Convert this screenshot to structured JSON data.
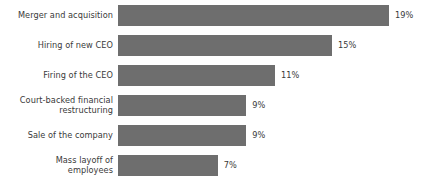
{
  "chart_data": {
    "type": "bar",
    "orientation": "horizontal",
    "title": "",
    "subtitle": "",
    "xlabel": "",
    "ylabel": "",
    "grid": false,
    "legend": null,
    "axis_visible": false,
    "xlim": [
      0,
      19
    ],
    "value_suffix": "%",
    "bar_color": "#6e6e6e",
    "label_color": "#3a3a3a",
    "background_color": "#ffffff",
    "categories": [
      "Merger and acquisition",
      "Hiring of new CEO",
      "Firing of the CEO",
      "Court-backed financial\nrestructuring",
      "Sale of the company",
      "Mass layoff of\nemployees"
    ],
    "values": [
      19,
      15,
      11,
      9,
      9,
      7
    ],
    "value_labels": [
      "19%",
      "15%",
      "11%",
      "9%",
      "9%",
      "7%"
    ],
    "bars": [
      {
        "category": "Merger and acquisition",
        "value": 19,
        "label": "19%"
      },
      {
        "category": "Hiring of new CEO",
        "value": 15,
        "label": "15%"
      },
      {
        "category": "Firing of the CEO",
        "value": 11,
        "label": "11%"
      },
      {
        "category": "Court-backed financial\nrestructuring",
        "value": 9,
        "label": "9%"
      },
      {
        "category": "Sale of the company",
        "value": 9,
        "label": "9%"
      },
      {
        "category": "Mass layoff of\nemployees",
        "value": 7,
        "label": "7%"
      }
    ]
  }
}
